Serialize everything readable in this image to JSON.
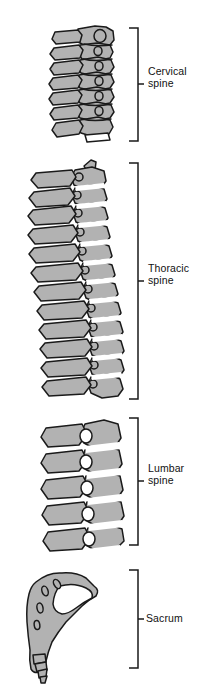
{
  "figure": {
    "background_color": "#ffffff",
    "bone_fill_color": "#b2b2b2",
    "outline_color": "#1a1a1a",
    "view": "lateral"
  },
  "regions": [
    {
      "id": "cervical",
      "label": "Cervical\nspine",
      "label_line1": "Cervical",
      "label_line2": "spine",
      "vertebra_count": 7,
      "bracket": {
        "top": 28,
        "bottom": 141,
        "x": 138,
        "arm": 9,
        "tick_y": 84
      },
      "label_x": 148,
      "label_y": 72
    },
    {
      "id": "thoracic",
      "label": "Thoracic\nspine",
      "label_line1": "Thoracic",
      "label_line2": "spine",
      "vertebra_count": 12,
      "bracket": {
        "top": 163,
        "bottom": 399,
        "x": 138,
        "arm": 9,
        "tick_y": 281
      },
      "label_x": 148,
      "label_y": 269
    },
    {
      "id": "lumbar",
      "label": "Lumbar\nspine",
      "label_line1": "Lumbar",
      "label_line2": "spine",
      "vertebra_count": 5,
      "bracket": {
        "top": 418,
        "bottom": 545,
        "x": 138,
        "arm": 9,
        "tick_y": 481
      },
      "label_x": 148,
      "label_y": 469
    },
    {
      "id": "sacrum",
      "label": "Sacrum",
      "label_line1": "Sacrum",
      "label_line2": "",
      "vertebra_count": 1,
      "bracket": {
        "top": 570,
        "bottom": 668,
        "x": 138,
        "arm": 9,
        "tick_y": 619
      },
      "label_x": 146,
      "label_y": 613
    }
  ]
}
